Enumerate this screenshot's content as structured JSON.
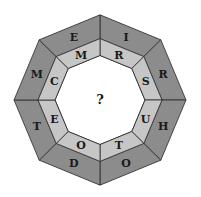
{
  "puzzle": {
    "center": "?",
    "outer_ring": [
      "I",
      "R",
      "H",
      "O",
      "D",
      "T",
      "M",
      "E"
    ],
    "inner_ring": [
      "R",
      "S",
      "U",
      "T",
      "O",
      "E",
      "C",
      "M"
    ],
    "colors": {
      "outer": "#8c8c8c",
      "inner": "#c6c6c6",
      "center": "#ffffff",
      "stroke": "#2a2a2a"
    }
  }
}
